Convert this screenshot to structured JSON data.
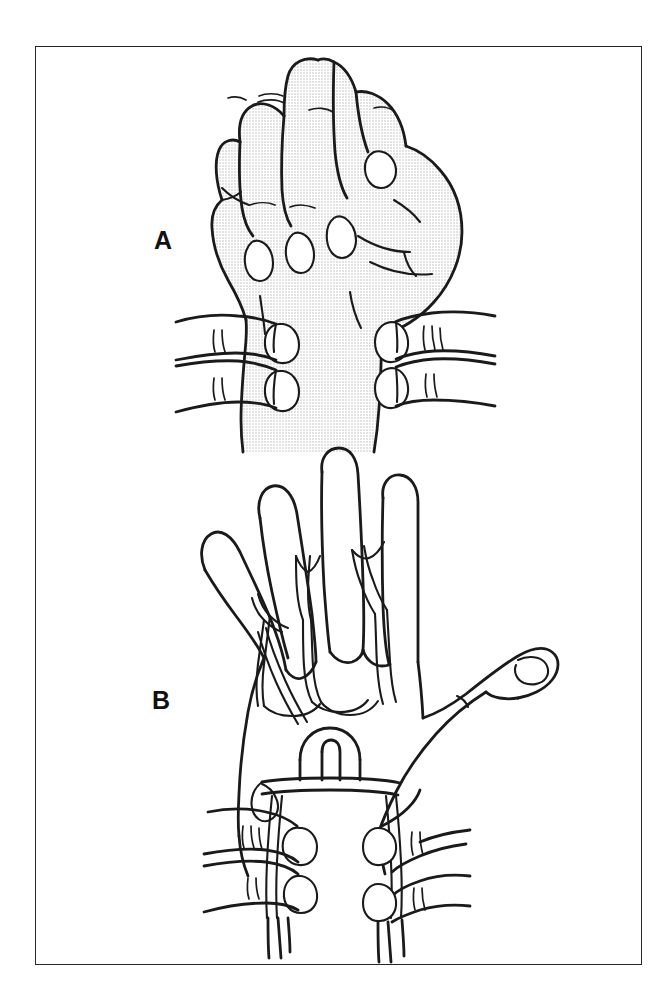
{
  "figure": {
    "kind": "anatomical-line-illustration",
    "panel_count": 2,
    "background_color": "#ffffff",
    "ink_color": "#1a1a1a",
    "frame": {
      "border_color": "#262626",
      "border_width_px": 1.4,
      "x": 35,
      "y": 46,
      "width": 607,
      "height": 919
    },
    "panels": [
      {
        "id": "A",
        "letter": "A",
        "label_x": 154,
        "label_y": 228,
        "description": "clenched fist seen from the dorsum, shaded with a gray halftone tone, gripped at the wrist by the examiner's two pairs of fingers",
        "shading": "halftone-gray",
        "shading_color": "#e9e9e9"
      },
      {
        "id": "B",
        "letter": "B",
        "label_x": 152,
        "label_y": 688,
        "description": "open hand seen from the dorsum with the thumb abducted, showing the distended dorsal venous arch and digital veins, wrist still compressed by the examiner's fingers",
        "shading": "none",
        "shading_color": "#ffffff"
      }
    ]
  },
  "colors": {
    "page_background": "#ffffff",
    "ink": "#1a1a1a",
    "frame_rule": "#262626",
    "halftone_fill": "#e9e9e9",
    "label_text": "#111111"
  }
}
